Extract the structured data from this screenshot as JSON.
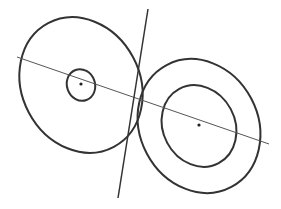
{
  "diagram": {
    "type": "geometry",
    "colors": {
      "background": "#ffffff",
      "stroke": "#333333",
      "thin_stroke": "#555555",
      "dot": "#222222"
    },
    "left_figure": {
      "outer_ellipse": {
        "cx": 81,
        "cy": 85,
        "rx": 59,
        "ry": 70,
        "rotate": -28
      },
      "inner_ellipse": {
        "cx": 81,
        "cy": 85,
        "rx": 14,
        "ry": 16,
        "rotate": -20
      },
      "center_point": {
        "x": 81,
        "y": 84
      }
    },
    "right_figure": {
      "outer_ellipse": {
        "cx": 199,
        "cy": 126,
        "rx": 59,
        "ry": 69,
        "rotate": -28
      },
      "inner_ellipse": {
        "cx": 199,
        "cy": 126,
        "rx": 36,
        "ry": 42,
        "rotate": -28
      },
      "center_point": {
        "x": 199,
        "y": 125
      }
    },
    "center_line": {
      "x1": 17,
      "y1": 57,
      "x2": 269,
      "y2": 144
    },
    "tangent_line": {
      "x1": 148,
      "y1": 9,
      "x2": 118,
      "y2": 198
    }
  }
}
